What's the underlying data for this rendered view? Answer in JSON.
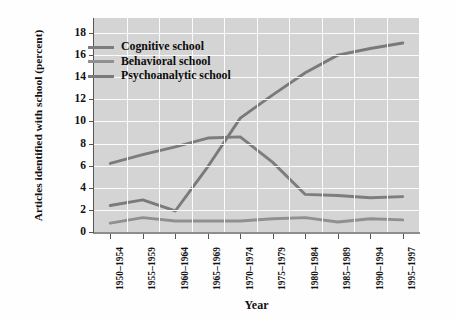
{
  "chart_data": {
    "type": "line",
    "title": "",
    "xlabel": "Year",
    "ylabel": "Articles identified with school (percent)",
    "categories": [
      "1950–1954",
      "1955–1959",
      "1960–1964",
      "1965–1969",
      "1970–1974",
      "1975–1979",
      "1980–1984",
      "1985–1989",
      "1990–1994",
      "1995–1997"
    ],
    "yticks": [
      0,
      2,
      4,
      6,
      8,
      10,
      12,
      14,
      16,
      18
    ],
    "ylim": [
      0,
      18
    ],
    "grid": true,
    "legend_position": "top-left",
    "series": [
      {
        "name": "Cognitive school",
        "color": "#7d7d7d",
        "values": [
          6.2,
          7.0,
          7.7,
          8.5,
          8.6,
          6.3,
          3.4,
          3.3,
          3.1,
          3.2
        ]
      },
      {
        "name": "Behavioral school",
        "color": "#909090",
        "values": [
          0.8,
          1.3,
          1.0,
          1.0,
          1.0,
          1.2,
          1.3,
          0.9,
          1.2,
          1.1
        ]
      },
      {
        "name": "Psychoanalytic school",
        "color": "#7a7a7a",
        "values": [
          2.4,
          2.9,
          1.9,
          5.9,
          10.3,
          12.4,
          14.4,
          16.0,
          16.6,
          17.1
        ]
      }
    ]
  },
  "legend": {
    "items": [
      {
        "label": "Cognitive school"
      },
      {
        "label": "Behavioral school"
      },
      {
        "label": "Psychoanalytic school"
      }
    ]
  },
  "colors": {
    "plot_background": "#d4d4d4",
    "gridline": "#fbfbfb",
    "axis": "#555555",
    "page_background": "#ffffff"
  }
}
